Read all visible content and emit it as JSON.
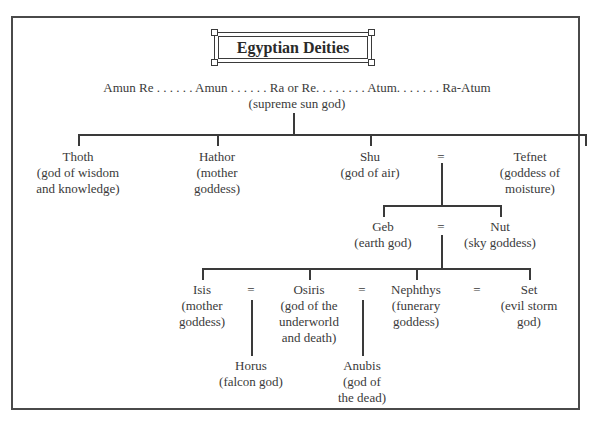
{
  "title": "Egyptian Deities",
  "supreme": {
    "names_line": "Amun Re . . . . . . Amun . . . . . . Ra or Re. . . . . . . . Atum. . . . . . . Ra-Atum",
    "desc": "(supreme sun god)"
  },
  "generation1": [
    {
      "name": "Thoth",
      "desc": [
        "(god of wisdom",
        "and knowledge)"
      ]
    },
    {
      "name": "Hathor",
      "desc": [
        "(mother",
        "goddess)"
      ]
    },
    {
      "name": "Shu",
      "desc": [
        "(god of air)"
      ]
    },
    {
      "name": "Tefnet",
      "desc": [
        "(goddess of",
        "moisture)"
      ]
    }
  ],
  "generation2": [
    {
      "name": "Geb",
      "desc": [
        "(earth god)"
      ]
    },
    {
      "name": "Nut",
      "desc": [
        "(sky goddess)"
      ]
    }
  ],
  "generation3": [
    {
      "name": "Isis",
      "desc": [
        "(mother",
        "goddess)"
      ]
    },
    {
      "name": "Osiris",
      "desc": [
        "(god of the",
        "underworld",
        "and death)"
      ]
    },
    {
      "name": "Nephthys",
      "desc": [
        "(funerary",
        "goddess)"
      ]
    },
    {
      "name": "Set",
      "desc": [
        "(evil storm",
        "god)"
      ]
    }
  ],
  "generation4": [
    {
      "name": "Horus",
      "desc": [
        "(falcon god)"
      ]
    },
    {
      "name": "Anubis",
      "desc": [
        "(god of",
        "the dead)"
      ]
    }
  ],
  "marriage_symbol": "="
}
